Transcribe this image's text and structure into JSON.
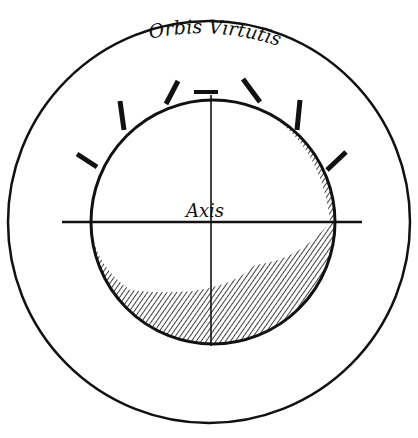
{
  "diagram": {
    "title": "Orbis Virtutis",
    "center_label": "Axis",
    "colors": {
      "ink": "#111111",
      "paper": "#ffffff"
    },
    "outer_circle": {
      "cx": 209,
      "cy": 222,
      "r": 201
    },
    "sphere": {
      "cx": 213,
      "cy": 222,
      "r": 122
    },
    "stubs_count": 7
  }
}
